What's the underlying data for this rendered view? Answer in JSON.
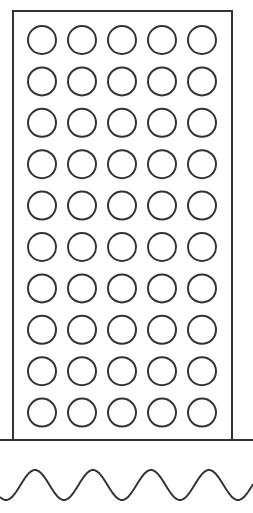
{
  "diagram": {
    "colors": {
      "stroke": "#333333",
      "background": "#ffffff"
    },
    "rectangle": {
      "x": 13,
      "y": 11,
      "width": 219,
      "height": 429
    },
    "grid": {
      "rows": 10,
      "columns": 5,
      "circle_count": 50,
      "radius": 14,
      "first_center": [
        42,
        40
      ],
      "dx": 40,
      "dy": 41.4
    },
    "baseline": {
      "y": 440
    },
    "wave": {
      "peak_y": 470,
      "trough_y": 500,
      "period": 58,
      "cycles": 4
    }
  }
}
